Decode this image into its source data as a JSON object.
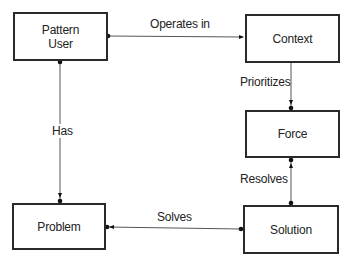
{
  "diagram": {
    "nodes": [
      {
        "id": "pattern-user",
        "label_line1": "Pattern",
        "label_line2": "User"
      },
      {
        "id": "context",
        "label": "Context"
      },
      {
        "id": "force",
        "label": "Force"
      },
      {
        "id": "problem",
        "label": "Problem"
      },
      {
        "id": "solution",
        "label": "Solution"
      }
    ],
    "edges": [
      {
        "from": "pattern-user",
        "to": "context",
        "label": "Operates in"
      },
      {
        "from": "context",
        "to": "force",
        "label": "Prioritizes"
      },
      {
        "from": "solution",
        "to": "force",
        "label": "Resolves"
      },
      {
        "from": "solution",
        "to": "problem",
        "label": "Solves"
      },
      {
        "from": "pattern-user",
        "to": "problem",
        "label": "Has"
      }
    ],
    "colors": {
      "stroke": "#2a2a2a",
      "line": "#555555"
    }
  }
}
